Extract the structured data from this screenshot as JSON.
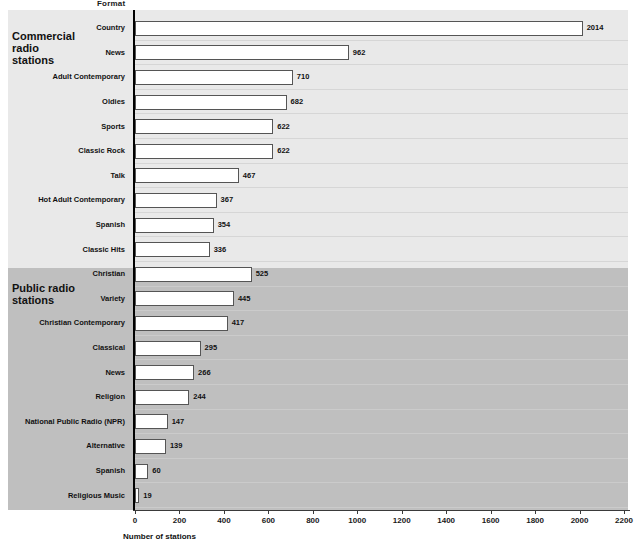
{
  "axis_title_top": "Format",
  "x_axis_title": "Number of stations",
  "groups": [
    {
      "id": "commercial",
      "label": "Commercial radio stations"
    },
    {
      "id": "public",
      "label": "Public radio stations"
    }
  ],
  "chart_data": {
    "type": "bar",
    "orientation": "horizontal",
    "title": "",
    "xlabel": "Number of stations",
    "ylabel": "Format",
    "xlim": [
      0,
      2200
    ],
    "grid": false,
    "legend": null,
    "xticks": [
      0,
      200,
      400,
      600,
      800,
      1000,
      1200,
      1400,
      1600,
      1800,
      2000,
      2200
    ],
    "xtick_labels": [
      "0",
      "200",
      "400",
      "600",
      "800",
      "1000",
      "1200",
      "1400",
      "1600",
      "1800",
      "2000",
      "2200"
    ],
    "bands": [
      {
        "name": "Commercial radio stations",
        "color": "#e9e9e9"
      },
      {
        "name": "Public radio stations",
        "color": "#bfbfbf"
      }
    ],
    "categories": [
      "Country",
      "News",
      "Adult Contemporary",
      "Oldies",
      "Sports",
      "Classic Rock",
      "Talk",
      "Hot Adult Contemporary",
      "Spanish",
      "Classic Hits",
      "Christian",
      "Variety",
      "Christian Contemporary",
      "Classical",
      "News",
      "Religion",
      "National Public Radio (NPR)",
      "Alternative",
      "Spanish",
      "Religious Music"
    ],
    "values": [
      2014,
      962,
      710,
      682,
      622,
      622,
      467,
      367,
      354,
      336,
      525,
      445,
      417,
      295,
      266,
      244,
      147,
      139,
      60,
      19
    ],
    "value_labels": [
      "2014",
      "962",
      "710",
      "682",
      "622",
      "622",
      "467",
      "367",
      "354",
      "336",
      "525",
      "445",
      "417",
      "295",
      "266",
      "244",
      "147",
      "139",
      "60",
      "19"
    ],
    "group_of_category": [
      "commercial",
      "commercial",
      "commercial",
      "commercial",
      "commercial",
      "commercial",
      "commercial",
      "commercial",
      "commercial",
      "commercial",
      "public",
      "public",
      "public",
      "public",
      "public",
      "public",
      "public",
      "public",
      "public",
      "public"
    ]
  }
}
